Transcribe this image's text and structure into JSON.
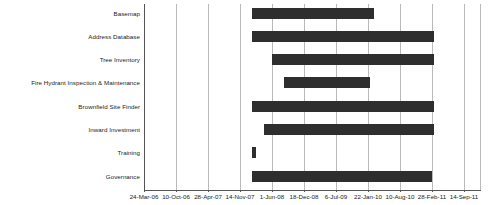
{
  "chart_data": {
    "type": "bar",
    "orientation": "horizontal",
    "subtype": "gantt",
    "title": "",
    "xlabel": "",
    "ylabel": "",
    "grid": true,
    "legend": null,
    "bar_color": "#2e2e2e",
    "gridline_color": "#b9b9b9",
    "axis_color": "#555555",
    "background_color": "#ffffff",
    "x_axis": {
      "tick_labels": [
        "24-Mar-06",
        "10-Oct-06",
        "28-Apr-07",
        "14-Nov-07",
        "1-Jun-08",
        "18-Dec-08",
        "6-Jul-09",
        "22-Jan-10",
        "10-Aug-10",
        "28-Feb-11",
        "14-Sep-11"
      ],
      "range": [
        "24-Mar-06",
        "14-Sep-11"
      ]
    },
    "categories": [
      "Basemap",
      "Address Database",
      "Tree Inventory",
      "Fire Hydrant Inspection & Maintenance",
      "Brownfield Site Finder",
      "Inward Investment",
      "Training",
      "Governance"
    ],
    "tasks": [
      {
        "name": "Basemap",
        "start": "14-Nov-07",
        "end": "22-Jan-10"
      },
      {
        "name": "Address Database",
        "start": "14-Nov-07",
        "end": "10-Aug-10"
      },
      {
        "name": "Tree Inventory",
        "start": "1-Jun-08",
        "end": "10-Aug-10"
      },
      {
        "name": "Fire Hydrant Inspection & Maintenance",
        "start": "1-Dec-08",
        "end": "22-Jan-10"
      },
      {
        "name": "Brownfield Site Finder",
        "start": "14-Nov-07",
        "end": "10-Aug-10"
      },
      {
        "name": "Inward Investment",
        "start": "1-Mar-08",
        "end": "10-Aug-10"
      },
      {
        "name": "Training",
        "start": "14-Nov-07",
        "end": "25-Nov-07"
      },
      {
        "name": "Governance",
        "start": "14-Nov-07",
        "end": "1-Aug-10"
      }
    ]
  },
  "rows": [
    {
      "label": "Basemap",
      "bar_left_px": 108,
      "bar_width_px": 122,
      "bar_top_px": 4
    },
    {
      "label": "Address Database",
      "bar_left_px": 108,
      "bar_width_px": 182,
      "bar_top_px": 27
    },
    {
      "label": "Tree Inventory",
      "bar_left_px": 128,
      "bar_width_px": 162,
      "bar_top_px": 50
    },
    {
      "label": "Fire Hydrant Inspection & Maintenance",
      "bar_left_px": 140,
      "bar_width_px": 86,
      "bar_top_px": 73
    },
    {
      "label": "Brownfield Site Finder",
      "bar_left_px": 108,
      "bar_width_px": 182,
      "bar_top_px": 97
    },
    {
      "label": "Inward Investment",
      "bar_left_px": 120,
      "bar_width_px": 170,
      "bar_top_px": 120
    },
    {
      "label": "Training",
      "bar_left_px": 108,
      "bar_width_px": 4,
      "bar_top_px": 143
    },
    {
      "label": "Governance",
      "bar_left_px": 108,
      "bar_width_px": 180,
      "bar_top_px": 167
    }
  ],
  "label_tops_px": [
    6,
    29,
    52,
    75,
    99,
    122,
    145,
    169
  ],
  "gridlines_px": [
    32,
    64,
    96,
    128,
    160,
    192,
    224,
    256,
    288,
    320,
    336
  ],
  "tick_px": [
    144,
    176,
    208,
    240,
    272,
    304,
    336,
    368,
    400,
    432,
    464
  ]
}
